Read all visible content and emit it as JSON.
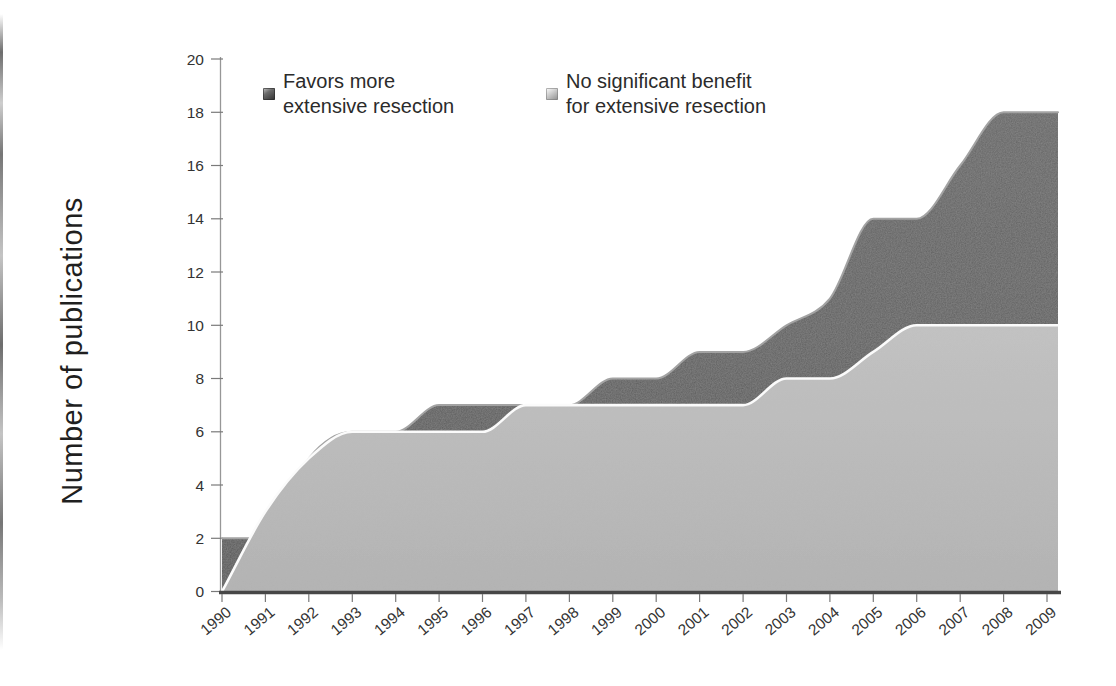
{
  "figure": {
    "ylabel": "Number of publications",
    "legend": [
      {
        "lines": [
          "Favors more",
          "extensive resection"
        ]
      },
      {
        "lines": [
          "No significant benefit",
          "for extensive resection"
        ]
      }
    ]
  },
  "chart_data": {
    "type": "area",
    "stacked": false,
    "title": "",
    "xlabel": "",
    "ylabel": "Number of publications",
    "x": [
      1990,
      1991,
      1992,
      1993,
      1994,
      1995,
      1996,
      1997,
      1998,
      1999,
      2000,
      2001,
      2002,
      2003,
      2004,
      2005,
      2006,
      2007,
      2008,
      2009
    ],
    "ylim": [
      0,
      20
    ],
    "yticks": [
      0,
      2,
      4,
      6,
      8,
      10,
      12,
      14,
      16,
      18,
      20
    ],
    "grid": false,
    "legend_position": "top-inside",
    "series": [
      {
        "name": "Favors more extensive resection",
        "color": "#565656",
        "color_top": "#656565",
        "edge_color": "#a3a3a3",
        "values": [
          2,
          2,
          5,
          6,
          6,
          7,
          7,
          7,
          7,
          8,
          8,
          9,
          9,
          10,
          11,
          14,
          14,
          16,
          18,
          18
        ]
      },
      {
        "name": "No significant benefit for extensive resection",
        "color": "#b2b2b2",
        "color_top": "#c3c3c3",
        "edge_color": "#fbfbfb",
        "values": [
          0,
          3,
          5,
          6,
          6,
          6,
          6,
          7,
          7,
          7,
          7,
          7,
          7,
          8,
          8,
          9,
          10,
          10,
          10,
          10
        ]
      }
    ],
    "axis_colors": {
      "baseline": "#474747",
      "axis_line": "#979797",
      "tick": "#7a7a7a",
      "tick_label": "#333333"
    }
  }
}
